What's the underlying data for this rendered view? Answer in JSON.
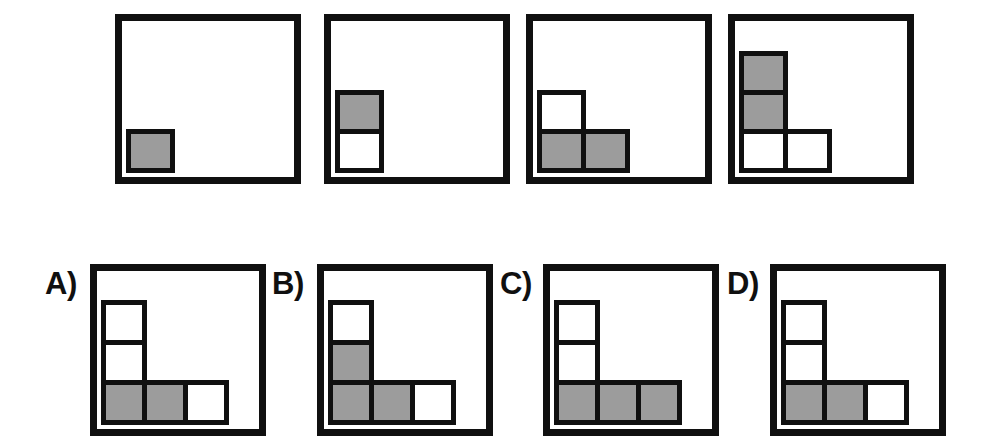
{
  "puzzle": {
    "kind": "visual-sequence-matrix",
    "colors": {
      "frame": "#101010",
      "cell_border": "#101010",
      "filled": "#9c9c9c",
      "empty": "#ffffff",
      "background": "#ffffff"
    },
    "grid": {
      "columns": 3,
      "rows": 3,
      "note": "cells are anchored to the bottom-left corner of each panel"
    },
    "sequence": {
      "name": "sequence-row",
      "count": 4,
      "panels": [
        {
          "index": 1,
          "name": "sequence-panel-1",
          "frame": {
            "x": 115,
            "y": 14,
            "width": 186,
            "height": 170
          },
          "cells": [
            {
              "col": 0,
              "row": 2,
              "fill": "filled"
            }
          ]
        },
        {
          "index": 2,
          "name": "sequence-panel-2",
          "frame": {
            "x": 324,
            "y": 14,
            "width": 186,
            "height": 170
          },
          "cells": [
            {
              "col": 0,
              "row": 1,
              "fill": "filled"
            },
            {
              "col": 0,
              "row": 2,
              "fill": "empty"
            }
          ]
        },
        {
          "index": 3,
          "name": "sequence-panel-3",
          "frame": {
            "x": 526,
            "y": 14,
            "width": 186,
            "height": 170
          },
          "cells": [
            {
              "col": 0,
              "row": 1,
              "fill": "empty"
            },
            {
              "col": 0,
              "row": 2,
              "fill": "filled"
            },
            {
              "col": 1,
              "row": 2,
              "fill": "filled"
            }
          ]
        },
        {
          "index": 4,
          "name": "sequence-panel-4",
          "frame": {
            "x": 728,
            "y": 14,
            "width": 186,
            "height": 170
          },
          "cells": [
            {
              "col": 0,
              "row": 0,
              "fill": "filled"
            },
            {
              "col": 0,
              "row": 1,
              "fill": "filled"
            },
            {
              "col": 0,
              "row": 2,
              "fill": "empty"
            },
            {
              "col": 1,
              "row": 2,
              "fill": "empty"
            }
          ]
        }
      ]
    },
    "options": {
      "name": "options-row",
      "count": 4,
      "items": [
        {
          "letter": "A)",
          "name": "option-a",
          "label": {
            "x": 45,
            "y": 268
          },
          "frame": {
            "x": 90,
            "y": 264,
            "width": 176,
            "height": 172
          },
          "cells": [
            {
              "col": 0,
              "row": 0,
              "fill": "empty"
            },
            {
              "col": 0,
              "row": 1,
              "fill": "empty"
            },
            {
              "col": 0,
              "row": 2,
              "fill": "filled"
            },
            {
              "col": 1,
              "row": 2,
              "fill": "filled"
            },
            {
              "col": 2,
              "row": 2,
              "fill": "empty"
            }
          ]
        },
        {
          "letter": "B)",
          "name": "option-b",
          "label": {
            "x": 272,
            "y": 268
          },
          "frame": {
            "x": 317,
            "y": 264,
            "width": 176,
            "height": 172
          },
          "cells": [
            {
              "col": 0,
              "row": 0,
              "fill": "empty"
            },
            {
              "col": 0,
              "row": 1,
              "fill": "filled"
            },
            {
              "col": 0,
              "row": 2,
              "fill": "filled"
            },
            {
              "col": 1,
              "row": 2,
              "fill": "filled"
            },
            {
              "col": 2,
              "row": 2,
              "fill": "empty"
            }
          ]
        },
        {
          "letter": "C)",
          "name": "option-c",
          "label": {
            "x": 500,
            "y": 268
          },
          "frame": {
            "x": 543,
            "y": 264,
            "width": 176,
            "height": 172
          },
          "cells": [
            {
              "col": 0,
              "row": 0,
              "fill": "empty"
            },
            {
              "col": 0,
              "row": 1,
              "fill": "empty"
            },
            {
              "col": 0,
              "row": 2,
              "fill": "filled"
            },
            {
              "col": 1,
              "row": 2,
              "fill": "filled"
            },
            {
              "col": 2,
              "row": 2,
              "fill": "filled"
            }
          ]
        },
        {
          "letter": "D)",
          "name": "option-d",
          "label": {
            "x": 727,
            "y": 268
          },
          "frame": {
            "x": 770,
            "y": 264,
            "width": 176,
            "height": 172
          },
          "cells": [
            {
              "col": 0,
              "row": 0,
              "fill": "empty"
            },
            {
              "col": 0,
              "row": 1,
              "fill": "empty"
            },
            {
              "col": 0,
              "row": 2,
              "fill": "filled"
            },
            {
              "col": 1,
              "row": 2,
              "fill": "filled"
            },
            {
              "col": 2,
              "row": 2,
              "fill": "empty"
            }
          ]
        }
      ]
    }
  }
}
